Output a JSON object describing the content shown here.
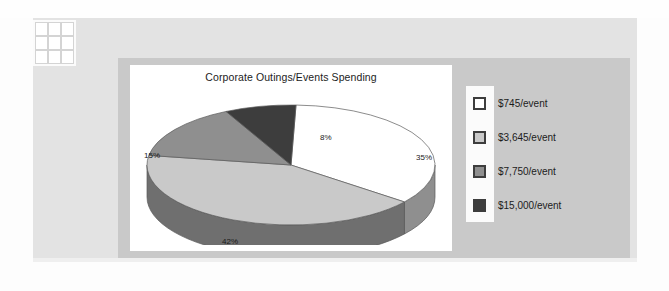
{
  "slide": {
    "background_color": "#e3e3e3",
    "page_color": "#fdfdfd",
    "grid_decoration_name": "grid-3x3-icon"
  },
  "chart_frame": {
    "frame_color": "#c9c9c9",
    "plot_background": "#ffffff"
  },
  "chart_data": {
    "type": "pie",
    "title": "Corporate Outings/Events Spending",
    "xlabel": "",
    "ylabel": "",
    "three_d": true,
    "legend_position": "right",
    "grid": false,
    "categories": [
      "$745/event",
      "$3,645/event",
      "$7,750/event",
      "$15,000/event"
    ],
    "values": [
      35,
      42,
      15,
      8
    ],
    "data_labels": [
      "35%",
      "42%",
      "15%",
      "8%"
    ],
    "colors": [
      "#ffffff",
      "#c9c9c9",
      "#8f8f8f",
      "#3d3d3d"
    ],
    "side_colors": [
      "#8f8f8f",
      "#6f6f6f",
      "#6f6f6f",
      "#2b2b2b"
    ],
    "slices": [
      {
        "label": "$745/event",
        "percent": 35,
        "data_label": "35%",
        "color": "#ffffff"
      },
      {
        "label": "$3,645/event",
        "percent": 42,
        "data_label": "42%",
        "color": "#c9c9c9"
      },
      {
        "label": "$7,750/event",
        "percent": 15,
        "data_label": "15%",
        "color": "#8f8f8f"
      },
      {
        "label": "$15,000/event",
        "percent": 8,
        "data_label": "8%",
        "color": "#3d3d3d"
      }
    ]
  },
  "legend": {
    "background": "#fbfbfb",
    "items": [
      {
        "label": "$745/event",
        "color": "#ffffff"
      },
      {
        "label": "$3,645/event",
        "color": "#c9c9c9"
      },
      {
        "label": "$7,750/event",
        "color": "#8f8f8f"
      },
      {
        "label": "$15,000/event",
        "color": "#3d3d3d"
      }
    ]
  }
}
